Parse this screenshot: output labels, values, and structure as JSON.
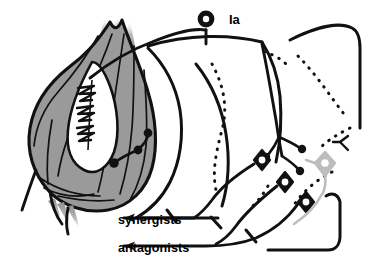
{
  "figure": {
    "background_color": "#ffffff",
    "width": 369,
    "height": 267
  },
  "labels": {
    "afferent": "Ia",
    "synergists": "synergists",
    "antagonists": "antagonists"
  },
  "colors": {
    "ink": "#111111",
    "muscle_fill": "#9a9a9a",
    "muscle_fill_light": "#b4b4b4",
    "spindle_fill": "#ffffff",
    "gamma_neuron": "#bdbdbd",
    "tendon_fade": "#c9c9c9"
  },
  "structures": {
    "muscle": {
      "name": "skeletal-muscle",
      "fill": "#9a9a9a",
      "description": "Fusiform skeletal muscle belly with tapering tendon fibers top and bottom"
    },
    "muscle_spindle": {
      "name": "muscle-spindle",
      "fill": "#ffffff",
      "annulospiral_endings": 3,
      "description": "White lens-shaped intrafusal capsule containing annulospiral sensory endings"
    },
    "dorsal_root_ganglion": {
      "name": "dorsal-root-ganglion",
      "shape": "ring",
      "outer_radius": 8,
      "inner_radius": 3.2
    },
    "spinal_cord": {
      "name": "spinal-cord",
      "gray_matter_style": "dotted",
      "description": "Spinal cord segment with dotted gray matter butterfly outline and solid white matter border"
    },
    "motor_neurons": {
      "alpha_count": 3,
      "gamma_count": 1,
      "shape": "four-point-star",
      "alpha_fill": "#111111",
      "gamma_fill": "#bdbdbd"
    },
    "motor_end_plates": {
      "name": "motor-end-plate",
      "count": 3,
      "fill": "#111111"
    },
    "terminal_boutons": {
      "name": "synaptic-bouton",
      "count": 3,
      "fill": "#111111"
    },
    "efferent_arrows": {
      "count": 2,
      "direction": "left",
      "targets": [
        "synergists",
        "antagonists"
      ]
    }
  }
}
